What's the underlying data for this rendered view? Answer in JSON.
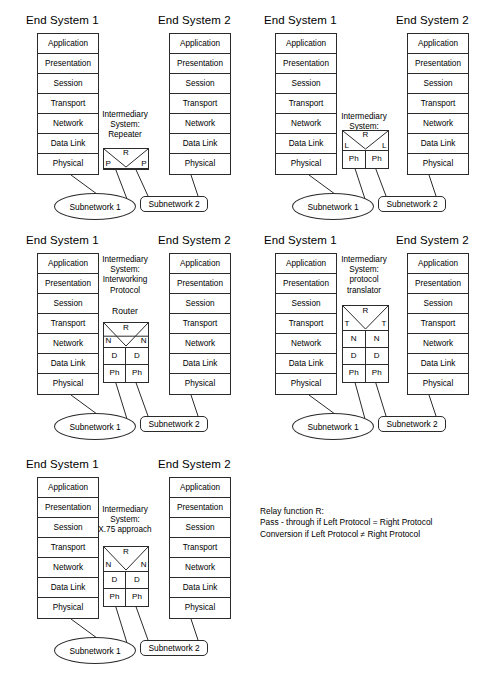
{
  "diagram": {
    "layers": [
      "Application",
      "Presentation",
      "Session",
      "Transport",
      "Network",
      "Data Link",
      "Physical"
    ],
    "end_system_1_label": "End System 1",
    "end_system_2_label": "End System 2",
    "subnetwork_1_label": "Subnetwork 1",
    "subnetwork_2_label": "Subnetwork 2"
  },
  "panels": [
    {
      "id": "repeater",
      "caption": "Intermediary\nSystem:\nRepeater",
      "caption_lines": [
        "Intermediary",
        "System:",
        "Repeater"
      ],
      "sublabel": "",
      "relay": {
        "left": "P",
        "center": "R",
        "right": "P"
      },
      "rows": []
    },
    {
      "id": "bridge",
      "caption_lines": [
        "Intermediary",
        "System:",
        "Bridge"
      ],
      "sublabel": "",
      "relay": {
        "left": "L",
        "center": "R",
        "right": "L"
      },
      "rows": [
        [
          "Ph",
          "Ph"
        ]
      ]
    },
    {
      "id": "router",
      "caption_lines": [
        "Intermediary",
        "System:",
        "Interworking",
        "Protocol"
      ],
      "sublabel": "Router",
      "relay": {
        "left": "N",
        "center": "R",
        "right": "N"
      },
      "rows": [
        [
          "D",
          "D"
        ],
        [
          "Ph",
          "Ph"
        ]
      ]
    },
    {
      "id": "protocol-translator",
      "caption_lines": [
        "Intermediary",
        "System:",
        "protocol",
        "translator"
      ],
      "sublabel": "",
      "relay": {
        "left": "T",
        "center": "R",
        "right": "T"
      },
      "rows": [
        [
          "N",
          "N"
        ],
        [
          "D",
          "D"
        ],
        [
          "Ph",
          "Ph"
        ]
      ]
    },
    {
      "id": "x75",
      "caption_lines": [
        "Intermediary",
        "System:",
        "X.75 approach"
      ],
      "sublabel": "",
      "relay": {
        "left": "N",
        "center": "R",
        "right": "N"
      },
      "rows": [
        [
          "D",
          "D"
        ],
        [
          "Ph",
          "Ph"
        ]
      ]
    }
  ],
  "legend": {
    "line1": "Relay function R:",
    "line2": "Pass - through if Left Protocol = Right Protocol",
    "line3": "Conversion if Left Protocol ≠ Right Protocol"
  },
  "colors": {
    "stroke": "#2b2b2b",
    "background": "#ffffff",
    "text": "#000000"
  }
}
